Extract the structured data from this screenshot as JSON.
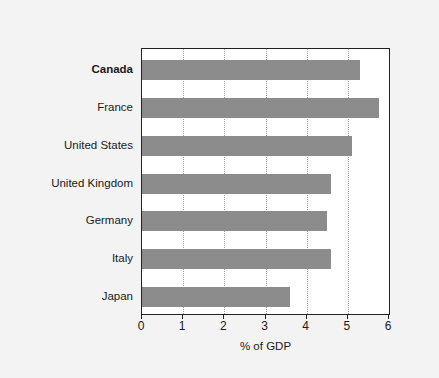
{
  "chart_data": {
    "type": "bar",
    "orientation": "horizontal",
    "title": "",
    "subtitle": "",
    "xlabel": "% of GDP",
    "ylabel": "",
    "xlim": [
      0,
      6
    ],
    "ylim": null,
    "grid": "vertical-dotted",
    "legend": null,
    "categories": [
      "Canada",
      "France",
      "United States",
      "United Kingdom",
      "Germany",
      "Italy",
      "Japan"
    ],
    "values": [
      5.3,
      5.75,
      5.1,
      4.6,
      4.5,
      4.6,
      3.6
    ],
    "highlighted_category": "Canada",
    "xticks": [
      0,
      1,
      2,
      3,
      4,
      5,
      6
    ],
    "xticklabels": [
      "0",
      "1",
      "2",
      "3",
      "4",
      "5",
      "6"
    ],
    "bar_color": "#8c8c8c",
    "background_color": "#f3f3f3",
    "plot_background_color": "#ffffff",
    "axis_color": "#222222",
    "gridline_color": "#9aa0a6"
  }
}
